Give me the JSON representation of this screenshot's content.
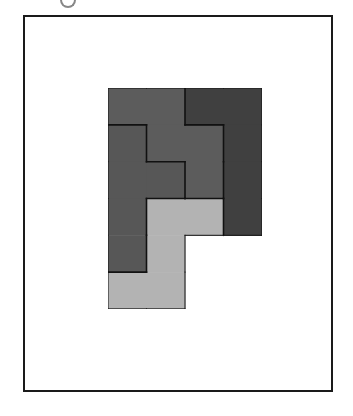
{
  "frame": {
    "border_color": "#1a1a1a",
    "background": "#ffffff"
  },
  "board": {
    "columns": 4,
    "rows": 6,
    "cell_width": 38.5,
    "cell_height": 36.8,
    "pieces": [
      {
        "id": "piece-a",
        "shade": "medium",
        "color": "#5c5c5c",
        "cells": [
          [
            0,
            0
          ],
          [
            1,
            0
          ],
          [
            1,
            1
          ],
          [
            2,
            1
          ],
          [
            2,
            2
          ]
        ]
      },
      {
        "id": "piece-b",
        "shade": "medium",
        "color": "#575757",
        "cells": [
          [
            0,
            1
          ],
          [
            0,
            2
          ],
          [
            1,
            2
          ],
          [
            0,
            3
          ],
          [
            0,
            4
          ]
        ]
      },
      {
        "id": "piece-c",
        "shade": "dark",
        "color": "#404040",
        "cells": [
          [
            2,
            0
          ],
          [
            3,
            0
          ],
          [
            3,
            1
          ],
          [
            3,
            2
          ],
          [
            3,
            3
          ]
        ]
      },
      {
        "id": "piece-d",
        "shade": "light",
        "color": "#b3b3b3",
        "cells": [
          [
            1,
            3
          ],
          [
            2,
            3
          ],
          [
            1,
            4
          ],
          [
            0,
            5
          ],
          [
            1,
            5
          ]
        ]
      }
    ],
    "outline_color": "#111111"
  }
}
